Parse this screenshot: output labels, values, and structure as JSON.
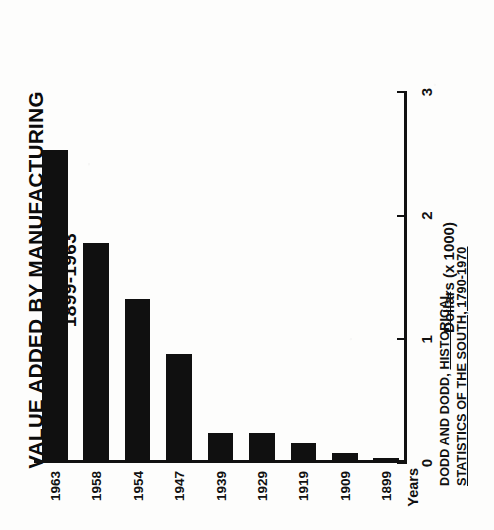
{
  "figure": {
    "title_line1": "VALUE ADDED BY MANUFACTURING",
    "title_line2": "1899-1963",
    "source_prefix": "DODD AND DODD, ",
    "source_cited_work": "HISTORICAL STATISTICS OF THE SOUTH, 1790-1970",
    "background_color": "#fdfdfc",
    "bar_color": "#101010",
    "axis_color": "#111111",
    "rotation_degrees": -90
  },
  "chart_data": {
    "type": "bar",
    "orientation": "horizontal",
    "title": "VALUE ADDED BY MANUFACTURING 1899-1963",
    "xlabel": "Dollars (x 1000)",
    "ylabel": "Years",
    "categories": [
      "1899",
      "1909",
      "1919",
      "1929",
      "1939",
      "1947",
      "1954",
      "1958",
      "1963"
    ],
    "values": [
      0.04,
      0.08,
      0.16,
      0.24,
      0.24,
      0.88,
      1.33,
      1.78,
      2.53
    ],
    "xlim": [
      0,
      3
    ],
    "xticks": [
      0,
      1,
      2,
      3
    ],
    "xtick_labels": [
      "0",
      "1",
      "2",
      "3"
    ],
    "grid": false,
    "legend": null,
    "series": [
      {
        "name": "Value added by manufacturing",
        "values": [
          0.04,
          0.08,
          0.16,
          0.24,
          0.24,
          0.88,
          1.33,
          1.78,
          2.53
        ]
      }
    ]
  }
}
